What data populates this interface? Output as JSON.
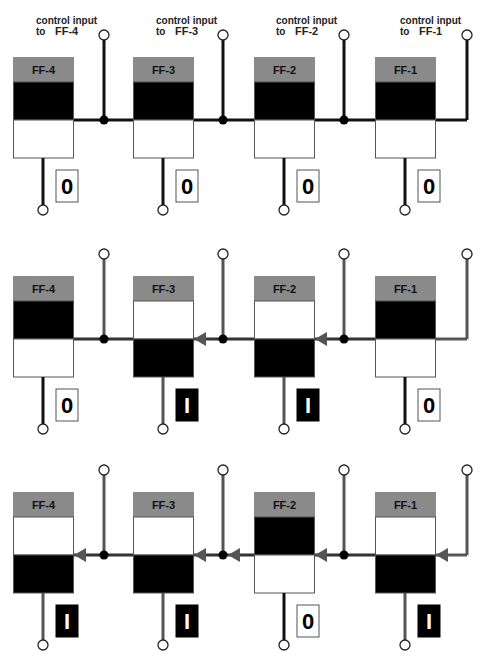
{
  "colors": {
    "header": "#8a8a8a",
    "black": "#000000",
    "white": "#ffffff",
    "wire_dark": "#111111",
    "wire_gray": "#555555",
    "arrow": "#555555"
  },
  "control_labels": [
    {
      "prefix": "control input",
      "to": "to",
      "ff": "FF-4"
    },
    {
      "prefix": "control input",
      "to": "to",
      "ff": "FF-3"
    },
    {
      "prefix": "control input",
      "to": "to",
      "ff": "FF-2"
    },
    {
      "prefix": "control input",
      "to": "to",
      "ff": "FF-1"
    }
  ],
  "rows": [
    {
      "name": "initial-state",
      "flipflops": [
        {
          "label": "FF-4",
          "state": "0"
        },
        {
          "label": "FF-3",
          "state": "0"
        },
        {
          "label": "FF-2",
          "state": "0"
        },
        {
          "label": "FF-1",
          "state": "0"
        }
      ],
      "arrows_into": []
    },
    {
      "name": "second-state",
      "flipflops": [
        {
          "label": "FF-4",
          "state": "0"
        },
        {
          "label": "FF-3",
          "state": "1"
        },
        {
          "label": "FF-2",
          "state": "1"
        },
        {
          "label": "FF-1",
          "state": "0"
        }
      ],
      "arrows_into": [
        "FF-3",
        "FF-2"
      ]
    },
    {
      "name": "third-state",
      "flipflops": [
        {
          "label": "FF-4",
          "state": "1"
        },
        {
          "label": "FF-3",
          "state": "1"
        },
        {
          "label": "FF-2",
          "state": "0"
        },
        {
          "label": "FF-1",
          "state": "1"
        }
      ],
      "arrows_into": [
        "FF-4",
        "FF-3",
        "FF-2",
        "FF-1"
      ],
      "extra_arrows": [
        "junction-3"
      ]
    }
  ],
  "bit_display": {
    "zero": "0",
    "one": "I"
  }
}
